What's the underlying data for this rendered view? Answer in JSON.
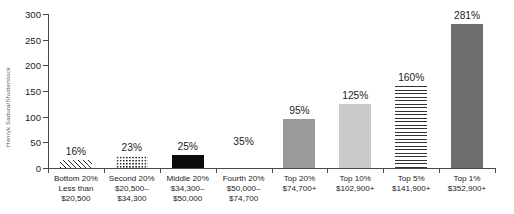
{
  "credit": "Henryk Sadura/Shutterstock",
  "chart_data": {
    "type": "bar",
    "title": "",
    "subtitle": "",
    "xlabel": "",
    "ylabel": "",
    "ylim": [
      0,
      300
    ],
    "y_ticks": [
      0,
      50,
      100,
      150,
      200,
      250,
      300
    ],
    "grid": false,
    "legend": "none",
    "categories": [
      "Bottom 20%\nLess than\n$20,500",
      "Second 20%\n$20,500–\n$34,300",
      "Middle 20%\n$34,300–\n$50,000",
      "Fourth 20%\n$50,000–\n$74,700",
      "Top 20%\n$74,700+",
      "Top 10%\n$102,900+",
      "Top 5%\n$141,900+",
      "Top 1%\n$352,900+"
    ],
    "values": [
      16,
      23,
      25,
      35,
      95,
      125,
      160,
      281
    ],
    "value_labels": [
      "16%",
      "23%",
      "25%",
      "35%",
      "95%",
      "125%",
      "160%",
      "281%"
    ],
    "bars": [
      {
        "label_lines": [
          "Bottom 20%",
          "Less than",
          "$20,500"
        ],
        "value": 16,
        "value_label": "16%",
        "fill": "diagonal-hatch"
      },
      {
        "label_lines": [
          "Second 20%",
          "$20,500–",
          "$34,300"
        ],
        "value": 23,
        "value_label": "23%",
        "fill": "dots"
      },
      {
        "label_lines": [
          "Middle 20%",
          "$34,300–",
          "$50,000"
        ],
        "value": 25,
        "value_label": "25%",
        "fill": "solid-black"
      },
      {
        "label_lines": [
          "Fourth 20%",
          "$50,000–",
          "$74,700"
        ],
        "value": 35,
        "value_label": "35%",
        "fill": "stipple"
      },
      {
        "label_lines": [
          "Top 20%",
          "$74,700+"
        ],
        "value": 95,
        "value_label": "95%",
        "fill": "gray-medium"
      },
      {
        "label_lines": [
          "Top 10%",
          "$102,900+"
        ],
        "value": 125,
        "value_label": "125%",
        "fill": "gray-light"
      },
      {
        "label_lines": [
          "Top 5%",
          "$141,900+"
        ],
        "value": 160,
        "value_label": "160%",
        "fill": "horizontal-lines"
      },
      {
        "label_lines": [
          "Top 1%",
          "$352,900+"
        ],
        "value": 281,
        "value_label": "281%",
        "fill": "gray-dark"
      }
    ],
    "colors": {
      "axis": "#4a4a4a",
      "text": "#1c1c1c",
      "solid_black": "#0b0b0b",
      "gray_medium": "#9a9a9a",
      "gray_light": "#c9c9c9",
      "gray_dark": "#6e6e6e"
    }
  }
}
